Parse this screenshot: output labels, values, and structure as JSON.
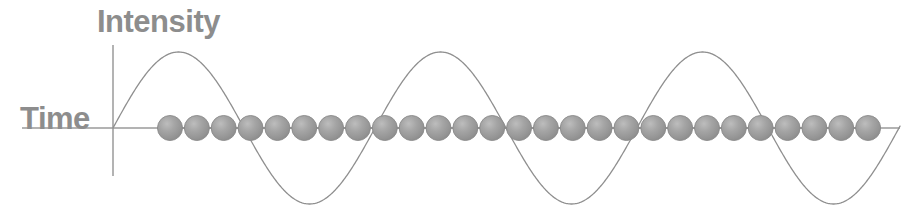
{
  "figure": {
    "width": 918,
    "height": 222,
    "background_color": "#ffffff"
  },
  "labels": {
    "y_axis": "Intensity",
    "x_axis": "Time",
    "text_color": "#8d8d8d",
    "font_size_px": 31
  },
  "axes": {
    "color": "#9a9a9a",
    "line_width": 1.4,
    "origin": {
      "x": 113,
      "y": 128
    },
    "x_axis": {
      "x_start": 22,
      "x_end": 900,
      "y": 128
    },
    "y_axis": {
      "x": 113,
      "y_start": 45,
      "y_end": 176
    }
  },
  "chart_data": {
    "type": "line",
    "title": "",
    "xlabel": "Time",
    "ylabel": "Intensity",
    "grid": false,
    "legend": "none",
    "series": [
      {
        "name": "Intensity wave",
        "shape": "sine",
        "color": "#8f8f8f",
        "line_width": 1.3,
        "amplitude_px": 76,
        "period_px": 262,
        "phase": "sin",
        "baseline_y": 128,
        "x_start": 113,
        "x_end": 900,
        "peaks_x": [
          178,
          440,
          702
        ],
        "zeros_x": [
          113,
          244,
          375,
          506,
          637,
          768,
          899
        ],
        "troughs_x": [
          309,
          571,
          833
        ],
        "peak_y": 52,
        "trough_y": 204
      },
      {
        "name": "Particle chain",
        "shape": "circles",
        "marker": "sphere",
        "fill_color": "#9b9b9b",
        "edge_color": "#8a8a8a",
        "highlight_color": "#b6b6b6",
        "count": 27,
        "radius_px": 12.5,
        "spacing_px": 26.85,
        "first_center_x": 170,
        "last_center_x": 868,
        "center_y": 128
      }
    ]
  }
}
